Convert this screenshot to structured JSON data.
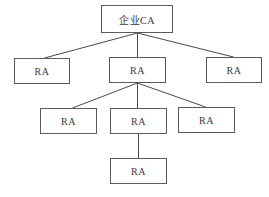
{
  "diagram": {
    "type": "tree",
    "colors": {
      "line": "#4a4a4a",
      "border": "#5a5a5a",
      "text": "#3a3a3a",
      "background": "#ffffff"
    },
    "nodes": [
      {
        "id": "root",
        "label": "企业CA",
        "x": 101,
        "y": 5,
        "w": 72,
        "h": 28
      },
      {
        "id": "ra1",
        "label": "RA",
        "x": 14,
        "y": 58,
        "w": 56,
        "h": 26
      },
      {
        "id": "ra2",
        "label": "RA",
        "x": 109,
        "y": 57,
        "w": 57,
        "h": 26
      },
      {
        "id": "ra3",
        "label": "RA",
        "x": 206,
        "y": 57,
        "w": 56,
        "h": 26
      },
      {
        "id": "ra4",
        "label": "RA",
        "x": 40,
        "y": 108,
        "w": 57,
        "h": 26
      },
      {
        "id": "ra5",
        "label": "RA",
        "x": 110,
        "y": 108,
        "w": 57,
        "h": 26
      },
      {
        "id": "ra6",
        "label": "RA",
        "x": 178,
        "y": 107,
        "w": 57,
        "h": 26
      },
      {
        "id": "ra7",
        "label": "RA",
        "x": 110,
        "y": 158,
        "w": 57,
        "h": 26
      }
    ],
    "edges": [
      {
        "from": "root",
        "to": "ra1",
        "x1": 137,
        "y1": 33,
        "x2": 44,
        "y2": 58
      },
      {
        "from": "root",
        "to": "ra2",
        "x1": 137,
        "y1": 33,
        "x2": 137,
        "y2": 57
      },
      {
        "from": "root",
        "to": "ra3",
        "x1": 137,
        "y1": 33,
        "x2": 233,
        "y2": 57
      },
      {
        "from": "ra2",
        "to": "ra4",
        "x1": 137,
        "y1": 83,
        "x2": 72,
        "y2": 108
      },
      {
        "from": "ra2",
        "to": "ra5",
        "x1": 137,
        "y1": 83,
        "x2": 137,
        "y2": 108
      },
      {
        "from": "ra2",
        "to": "ra6",
        "x1": 137,
        "y1": 83,
        "x2": 205,
        "y2": 107
      },
      {
        "from": "ra5",
        "to": "ra7",
        "x1": 138,
        "y1": 134,
        "x2": 138,
        "y2": 158
      }
    ]
  }
}
